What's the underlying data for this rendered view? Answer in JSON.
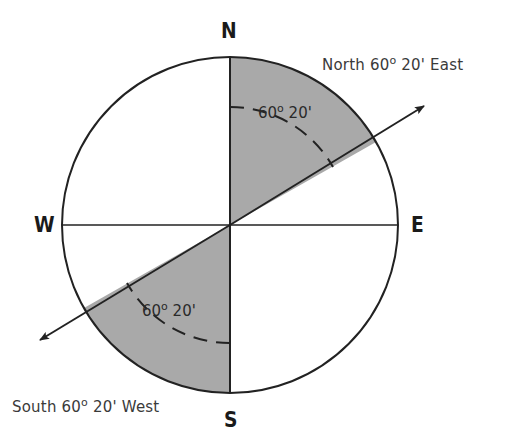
{
  "diagram": {
    "type": "compass-bearing",
    "cardinals": {
      "north": "N",
      "south": "S",
      "east": "E",
      "west": "W"
    },
    "bearings": [
      {
        "id": "ne",
        "prefix": "North 60",
        "degree_symbol": "o",
        "suffix": " 20' East"
      },
      {
        "id": "sw",
        "prefix": "South 60",
        "degree_symbol": "o",
        "suffix": " 20' West"
      }
    ],
    "angle_labels": [
      {
        "id": "upper",
        "prefix": "60",
        "degree_symbol": "o",
        "suffix": " 20'"
      },
      {
        "id": "lower",
        "prefix": "60",
        "degree_symbol": "o",
        "suffix": " 20'"
      }
    ],
    "colors": {
      "shade": "#a9a9a9",
      "stroke": "#222222",
      "background": "#ffffff"
    },
    "geometry": {
      "center": [
        230,
        225
      ],
      "radius": 168,
      "bearing_angle_deg": 60.33
    }
  }
}
